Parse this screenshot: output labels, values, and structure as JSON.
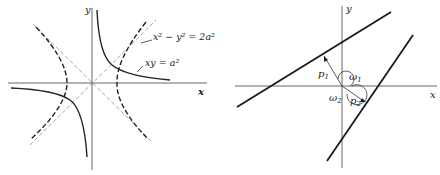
{
  "left_diagram": {
    "axis_x_label": "x",
    "axis_y_label": "y",
    "curve1_label": "x² − y² = 2a²",
    "curve2_label": "xy = a²",
    "curves": [
      {
        "name": "rectangular-hyperbola-xy",
        "equation": "xy = a^2",
        "style": "solid"
      },
      {
        "name": "hyperbola-x2-y2",
        "equation": "x^2 - y^2 = 2a^2",
        "style": "dashed"
      }
    ],
    "asymptotes": [
      "y = x",
      "y = -x"
    ]
  },
  "right_diagram": {
    "axis_x_label": "x",
    "axis_y_label": "y",
    "p1_label": "p",
    "p1_sub": "1",
    "p2_label": "p",
    "p2_sub": "2",
    "w1_label": "ω",
    "w1_sub": "1",
    "w2_label": "ω",
    "w2_sub": "2"
  }
}
